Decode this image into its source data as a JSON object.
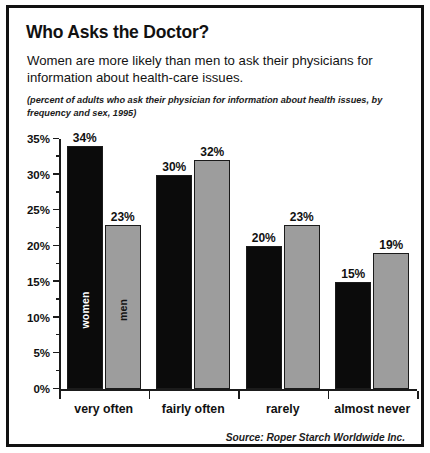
{
  "header": {
    "title": "Who Asks the Doctor?",
    "lede": "Women are more likely than men to ask their physicians for information about health-care issues.",
    "subnote": "(percent of adults who ask their physician for information about health issues, by frequency and sex, 1995)"
  },
  "footer": {
    "source": "Source: Roper Starch Worldwide Inc."
  },
  "colors": {
    "women_bar": "#0b0b0b",
    "men_bar": "#9d9d9d",
    "axis": "#1b1b1b",
    "text": "#111111",
    "frame": "#111111",
    "background": "#ffffff"
  },
  "axis": {
    "y_ticks": [
      "0%",
      "5%",
      "10%",
      "15%",
      "20%",
      "25%",
      "30%",
      "35%"
    ],
    "y_tick_values": [
      0,
      5,
      10,
      15,
      20,
      25,
      30,
      35
    ],
    "y_minor_values": [
      2.5,
      7.5,
      12.5,
      17.5,
      22.5,
      27.5,
      32.5
    ],
    "x_categories": [
      "very often",
      "fairly often",
      "rarely",
      "almost never"
    ]
  },
  "bar_inner_labels": {
    "women": "women",
    "men": "men"
  },
  "bars": [
    {
      "category": "very often",
      "women": 34,
      "men": 23,
      "women_label": "34%",
      "men_label": "23%"
    },
    {
      "category": "fairly often",
      "women": 30,
      "men": 32,
      "women_label": "30%",
      "men_label": "32%"
    },
    {
      "category": "rarely",
      "women": 20,
      "men": 23,
      "women_label": "20%",
      "men_label": "23%"
    },
    {
      "category": "almost never",
      "women": 15,
      "men": 19,
      "women_label": "15%",
      "men_label": "19%"
    }
  ],
  "chart_data": {
    "type": "bar",
    "title": "Who Asks the Doctor?",
    "subtitle": "Women are more likely than men to ask their physicians for information about health-care issues.",
    "annotation": "(percent of adults who ask their physician for information about health issues, by frequency and sex, 1995)",
    "source": "Source: Roper Starch Worldwide Inc.",
    "categories": [
      "very often",
      "fairly often",
      "rarely",
      "almost never"
    ],
    "series": [
      {
        "name": "women",
        "values": [
          34,
          30,
          20,
          15
        ],
        "color": "#0b0b0b"
      },
      {
        "name": "men",
        "values": [
          23,
          32,
          23,
          19
        ],
        "color": "#9d9d9d"
      }
    ],
    "xlabel": "",
    "ylabel": "",
    "ylim": [
      0,
      35
    ],
    "ytick_step": 5,
    "ytick_labels": [
      "0%",
      "5%",
      "10%",
      "15%",
      "20%",
      "25%",
      "30%",
      "35%"
    ],
    "grid": false,
    "legend": "in-bar labels on first group",
    "value_labels": true,
    "units": "percent"
  }
}
